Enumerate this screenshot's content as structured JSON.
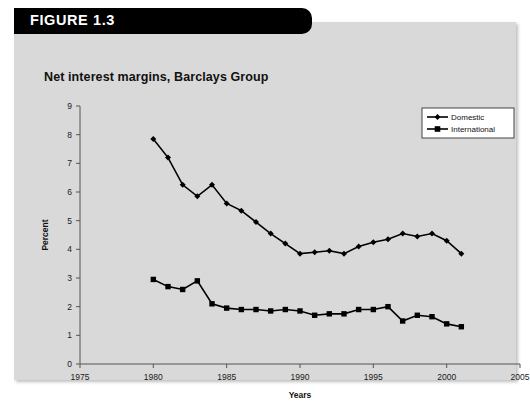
{
  "figure": {
    "banner_label": "FIGURE 1.3",
    "title": "Net interest margins, Barclays Group"
  },
  "chart_data": {
    "type": "line",
    "title": "Net interest margins, Barclays Group",
    "xlabel": "Years",
    "ylabel": "Percent",
    "xlim": [
      1975,
      2005
    ],
    "ylim": [
      0,
      9
    ],
    "xticks": [
      "1975",
      "1980",
      "1985",
      "1990",
      "1995",
      "2000",
      "2005"
    ],
    "yticks": [
      "0",
      "1",
      "2",
      "3",
      "4",
      "5",
      "6",
      "7",
      "8",
      "9"
    ],
    "grid": false,
    "legend_position": "top-right",
    "x": [
      1980,
      1981,
      1982,
      1983,
      1984,
      1985,
      1986,
      1987,
      1988,
      1989,
      1990,
      1991,
      1992,
      1993,
      1994,
      1995,
      1996,
      1997,
      1998,
      1999,
      2000,
      2001
    ],
    "series": [
      {
        "name": "Domestic",
        "marker": "diamond",
        "color": "#000000",
        "values": [
          7.85,
          7.2,
          6.25,
          5.85,
          6.25,
          5.6,
          5.35,
          4.95,
          4.55,
          4.2,
          3.85,
          3.9,
          3.95,
          3.85,
          4.1,
          4.25,
          4.35,
          4.55,
          4.45,
          4.55,
          4.3,
          3.85
        ]
      },
      {
        "name": "International",
        "marker": "square",
        "color": "#000000",
        "values": [
          2.95,
          2.7,
          2.6,
          2.9,
          2.1,
          1.95,
          1.9,
          1.9,
          1.85,
          1.9,
          1.85,
          1.7,
          1.75,
          1.75,
          1.9,
          1.9,
          2.0,
          1.5,
          1.7,
          1.65,
          1.4,
          1.3
        ]
      }
    ]
  }
}
